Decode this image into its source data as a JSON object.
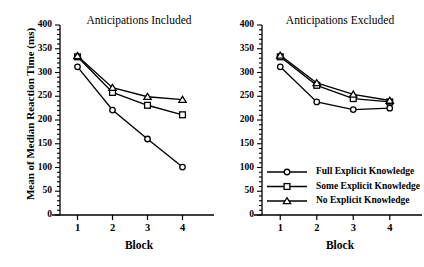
{
  "figure": {
    "ylabel": "Mean of Median Reaction Time (ms)",
    "xlabel_left": "Block",
    "xlabel_right": "Block",
    "panel_left_title": "Anticipations Included",
    "panel_right_title": "Anticipations Excluded",
    "ink_color": "#000000",
    "background_color": "#ffffff"
  },
  "yticks": [
    "400",
    "350",
    "300",
    "250",
    "200",
    "150",
    "100",
    "50",
    "0"
  ],
  "xticks": [
    "1",
    "2",
    "3",
    "4"
  ],
  "legend": {
    "items": [
      {
        "label": "Full Explicit Knowledge",
        "marker": "circle-marker"
      },
      {
        "label": "Some Explicit Knowledge",
        "marker": "square-marker"
      },
      {
        "label": "No Explicit Knowledge",
        "marker": "triangle-marker"
      }
    ]
  },
  "chart_data": [
    {
      "type": "line",
      "title": "Anticipations Included",
      "xlabel": "Block",
      "ylabel": "Mean of Median Reaction Time (ms)",
      "categories": [
        "1",
        "2",
        "3",
        "4"
      ],
      "x": [
        1,
        2,
        3,
        4
      ],
      "xlim": [
        0.5,
        4.5
      ],
      "ylim": [
        0,
        400
      ],
      "ytick_step": 50,
      "minor_ticks": true,
      "grid": false,
      "legend_position": "lower-right-of-figure",
      "series": [
        {
          "name": "Full Explicit Knowledge",
          "marker": "circle",
          "values": [
            312,
            221,
            160,
            101
          ]
        },
        {
          "name": "Some Explicit Knowledge",
          "marker": "square",
          "values": [
            333,
            258,
            231,
            211
          ]
        },
        {
          "name": "No Explicit Knowledge",
          "marker": "triangle",
          "values": [
            335,
            268,
            249,
            243
          ]
        }
      ]
    },
    {
      "type": "line",
      "title": "Anticipations Excluded",
      "xlabel": "Block",
      "ylabel": "Mean of Median Reaction Time (ms)",
      "categories": [
        "1",
        "2",
        "3",
        "4"
      ],
      "x": [
        1,
        2,
        3,
        4
      ],
      "xlim": [
        0.5,
        4.5
      ],
      "ylim": [
        0,
        400
      ],
      "ytick_step": 50,
      "minor_ticks": true,
      "grid": false,
      "legend_position": "inside-lower-left",
      "series": [
        {
          "name": "Full Explicit Knowledge",
          "marker": "circle",
          "values": [
            312,
            238,
            222,
            225
          ]
        },
        {
          "name": "Some Explicit Knowledge",
          "marker": "square",
          "values": [
            333,
            273,
            245,
            238
          ]
        },
        {
          "name": "No Explicit Knowledge",
          "marker": "triangle",
          "values": [
            336,
            278,
            254,
            241
          ]
        }
      ]
    }
  ]
}
